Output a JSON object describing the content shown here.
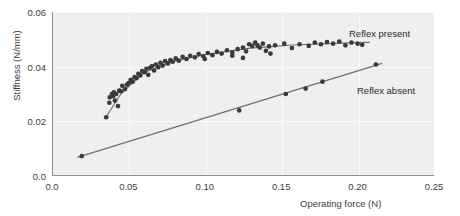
{
  "chart_data": {
    "type": "scatter",
    "title": "",
    "xlabel": "Operating force (N)",
    "ylabel": "Stiffness (N/mm)",
    "xlim": [
      0.0,
      0.25
    ],
    "ylim": [
      0.0,
      0.06
    ],
    "xticks": [
      "0.0",
      "0.05",
      "0.10",
      "0.15",
      "0.20",
      "0.25"
    ],
    "xtick_values": [
      0.0,
      0.05,
      0.1,
      0.15,
      0.2,
      0.25
    ],
    "yticks": [
      "0.0",
      "0.02",
      "0.04",
      "0.06"
    ],
    "ytick_values": [
      0.0,
      0.02,
      0.04,
      0.06
    ],
    "grid": true,
    "legend_position": "inline-annotation",
    "series": [
      {
        "name": "Reflex present",
        "annotation": "Reflex present",
        "marker": "filled-circle",
        "color": "#3a3a3a",
        "fit": "saturating-curve",
        "fit_color": "#6f6f6f",
        "points": [
          [
            0.0355,
            0.0215
          ],
          [
            0.0375,
            0.0268
          ],
          [
            0.0378,
            0.0288
          ],
          [
            0.0392,
            0.03
          ],
          [
            0.04,
            0.0292
          ],
          [
            0.0405,
            0.0306
          ],
          [
            0.0412,
            0.0276
          ],
          [
            0.042,
            0.03
          ],
          [
            0.0432,
            0.0256
          ],
          [
            0.044,
            0.0312
          ],
          [
            0.0452,
            0.031
          ],
          [
            0.046,
            0.033
          ],
          [
            0.0478,
            0.0318
          ],
          [
            0.049,
            0.0334
          ],
          [
            0.0502,
            0.034
          ],
          [
            0.0515,
            0.0352
          ],
          [
            0.0528,
            0.0345
          ],
          [
            0.054,
            0.0362
          ],
          [
            0.0552,
            0.0358
          ],
          [
            0.0565,
            0.0374
          ],
          [
            0.0578,
            0.0368
          ],
          [
            0.059,
            0.0384
          ],
          [
            0.0605,
            0.038
          ],
          [
            0.0618,
            0.0392
          ],
          [
            0.063,
            0.037
          ],
          [
            0.0642,
            0.0396
          ],
          [
            0.0655,
            0.0402
          ],
          [
            0.0668,
            0.0386
          ],
          [
            0.068,
            0.0408
          ],
          [
            0.0695,
            0.0398
          ],
          [
            0.071,
            0.0414
          ],
          [
            0.0725,
            0.0404
          ],
          [
            0.074,
            0.042
          ],
          [
            0.0758,
            0.0412
          ],
          [
            0.0775,
            0.0424
          ],
          [
            0.079,
            0.0418
          ],
          [
            0.081,
            0.043
          ],
          [
            0.083,
            0.0422
          ],
          [
            0.0855,
            0.0436
          ],
          [
            0.088,
            0.0428
          ],
          [
            0.0905,
            0.044
          ],
          [
            0.0935,
            0.0434
          ],
          [
            0.096,
            0.0446
          ],
          [
            0.099,
            0.0438
          ],
          [
            0.102,
            0.045
          ],
          [
            0.105,
            0.0442
          ],
          [
            0.108,
            0.0454
          ],
          [
            0.111,
            0.0448
          ],
          [
            0.1145,
            0.046
          ],
          [
            0.118,
            0.0452
          ],
          [
            0.1215,
            0.0464
          ],
          [
            0.125,
            0.047
          ],
          [
            0.127,
            0.0456
          ],
          [
            0.129,
            0.0482
          ],
          [
            0.131,
            0.0476
          ],
          [
            0.133,
            0.0488
          ],
          [
            0.1345,
            0.0478
          ],
          [
            0.136,
            0.047
          ],
          [
            0.138,
            0.0484
          ],
          [
            0.14,
            0.0458
          ],
          [
            0.142,
            0.0474
          ],
          [
            0.146,
            0.0478
          ],
          [
            0.152,
            0.0484
          ],
          [
            0.157,
            0.0468
          ],
          [
            0.162,
            0.0482
          ],
          [
            0.168,
            0.0476
          ],
          [
            0.172,
            0.0488
          ],
          [
            0.176,
            0.0482
          ],
          [
            0.18,
            0.049
          ],
          [
            0.184,
            0.0484
          ],
          [
            0.188,
            0.0492
          ],
          [
            0.192,
            0.0478
          ],
          [
            0.196,
            0.0488
          ],
          [
            0.2,
            0.0484
          ],
          [
            0.203,
            0.048
          ],
          [
            0.118,
            0.044
          ],
          [
            0.125,
            0.0432
          ],
          [
            0.1,
            0.0428
          ],
          [
            0.143,
            0.0448
          ]
        ],
        "fit_points": [
          [
            0.0345,
            0.0208
          ],
          [
            0.045,
            0.03
          ],
          [
            0.06,
            0.0378
          ],
          [
            0.08,
            0.042
          ],
          [
            0.1,
            0.0444
          ],
          [
            0.13,
            0.0468
          ],
          [
            0.16,
            0.048
          ],
          [
            0.2,
            0.0488
          ],
          [
            0.208,
            0.0489
          ]
        ]
      },
      {
        "name": "Reflex absent",
        "annotation": "Reflex absent",
        "marker": "filled-circle",
        "color": "#3a3a3a",
        "fit": "straight-line",
        "fit_color": "#6f6f6f",
        "points": [
          [
            0.0195,
            0.0073
          ],
          [
            0.1225,
            0.024
          ],
          [
            0.153,
            0.03
          ],
          [
            0.166,
            0.032
          ],
          [
            0.177,
            0.0345
          ],
          [
            0.212,
            0.0408
          ]
        ],
        "fit_points": [
          [
            0.0165,
            0.0068
          ],
          [
            0.216,
            0.0412
          ]
        ]
      }
    ]
  },
  "annotations": {
    "reflex_present_label": "Reflex present",
    "reflex_absent_label": "Reflex absent"
  }
}
